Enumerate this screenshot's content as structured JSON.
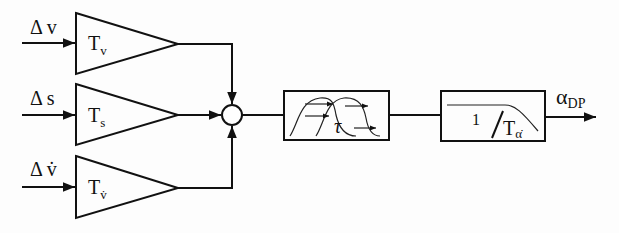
{
  "diagram": {
    "inputs": [
      {
        "label": "Δ v",
        "gain": "T",
        "gain_sub": "v"
      },
      {
        "label": "Δ s",
        "gain": "T",
        "gain_sub": "s"
      },
      {
        "label": "Δ v̇",
        "gain": "T",
        "gain_sub": "v̇"
      }
    ],
    "delay_block": {
      "label": "τ"
    },
    "filter_block": {
      "numerator": "1",
      "slash": "/",
      "denominator": "T",
      "denominator_sub": "α̇"
    },
    "output": {
      "label": "α",
      "label_sub": "DP"
    },
    "colors": {
      "stroke": "#111111",
      "background": "#fdfdfd"
    }
  }
}
